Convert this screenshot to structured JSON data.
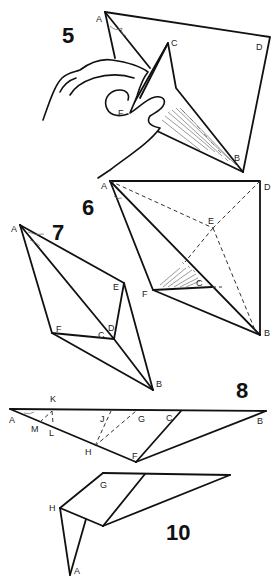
{
  "steps": {
    "s5": {
      "number": "5",
      "labels": {
        "A": "A",
        "C": "C",
        "D": "D",
        "F": "F",
        "B": "B"
      }
    },
    "s6": {
      "number": "6",
      "labels": {
        "A": "A",
        "D": "D",
        "E": "E",
        "C": "C",
        "F": "F",
        "B": "B"
      }
    },
    "s7": {
      "number": "7",
      "labels": {
        "A": "A",
        "E": "E",
        "D": "D",
        "C": "C",
        "F": "F",
        "B": "B"
      }
    },
    "s8": {
      "number": "8",
      "labels": {
        "K": "K",
        "A": "A",
        "M": "M",
        "L": "L",
        "J": "J",
        "G": "G",
        "C": "C",
        "B": "B",
        "H": "H",
        "F": "F"
      }
    },
    "s10": {
      "number": "10",
      "labels": {
        "G": "G",
        "H": "H",
        "A": "A"
      }
    }
  },
  "colors": {
    "line": "#111111",
    "background": "#ffffff"
  }
}
